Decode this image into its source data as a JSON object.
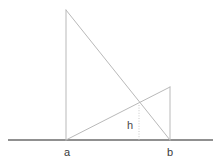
{
  "figure": {
    "canvas": {
      "width": 221,
      "height": 165,
      "background": "#ffffff"
    },
    "colors": {
      "baseline": "#6b6b6b",
      "triangle_stroke": "#b9b9b9",
      "dotted_stroke": "#c9c9c9",
      "label_text": "#3a3a3a",
      "height_label_text": "#4a4a4a"
    },
    "labels": {
      "a": "a",
      "b": "b",
      "h": "h"
    },
    "label_positions": {
      "a": {
        "x": 67,
        "y": 156
      },
      "b": {
        "x": 170,
        "y": 156
      },
      "h": {
        "x": 130,
        "y": 129
      }
    },
    "points": {
      "baseline_start": {
        "x": 8,
        "y": 140
      },
      "baseline_end": {
        "x": 213,
        "y": 140
      },
      "a": {
        "x": 66,
        "y": 140
      },
      "b": {
        "x": 170,
        "y": 140
      },
      "tall_apex": {
        "x": 66,
        "y": 10
      },
      "short_apex": {
        "x": 170,
        "y": 87
      },
      "intersection": {
        "x": 139,
        "y": 105
      },
      "height_foot": {
        "x": 139,
        "y": 140
      }
    },
    "segments": [
      {
        "name": "baseline",
        "from": "baseline_start",
        "to": "baseline_end"
      },
      {
        "name": "tall-triangle-left-side",
        "from": "tall_apex",
        "to": "a"
      },
      {
        "name": "tall-triangle-hypotenuse",
        "from": "tall_apex",
        "to": "b"
      },
      {
        "name": "short-triangle-hypotenuse",
        "from": "a",
        "to": "short_apex"
      },
      {
        "name": "short-triangle-right-side",
        "from": "short_apex",
        "to": "b"
      },
      {
        "name": "height-dotted-line",
        "from": "intersection",
        "to": "height_foot"
      }
    ]
  }
}
